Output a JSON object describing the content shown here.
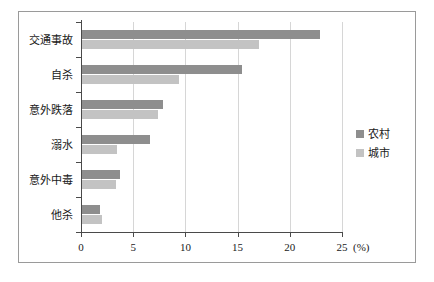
{
  "chart_data": {
    "type": "bar",
    "orientation": "horizontal",
    "title": "",
    "xlabel": "(%)",
    "ylabel": "",
    "xlim": [
      0,
      25
    ],
    "xticks": [
      "0",
      "5",
      "10",
      "15",
      "20",
      "25"
    ],
    "grid": true,
    "legend_position": "right",
    "categories": [
      "交通事故",
      "自杀",
      "意外跌落",
      "溺水",
      "意外中毒",
      "他杀"
    ],
    "series": [
      {
        "name": "农村",
        "color": "#8e8e8e",
        "values": [
          22.8,
          15.3,
          7.8,
          6.5,
          3.6,
          1.7
        ]
      },
      {
        "name": "城市",
        "color": "#c3c3c3",
        "values": [
          17.0,
          9.3,
          7.3,
          3.4,
          3.3,
          1.9
        ]
      }
    ]
  },
  "legend": {
    "items": [
      {
        "label": "农村",
        "color": "#8e8e8e"
      },
      {
        "label": "城市",
        "color": "#c3c3c3"
      }
    ]
  },
  "axis": {
    "unit_label": "(%)"
  }
}
